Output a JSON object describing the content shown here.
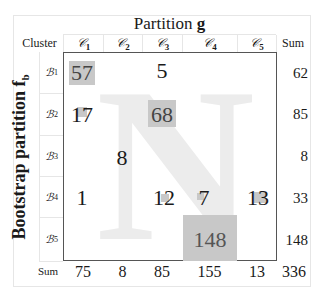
{
  "title": {
    "prefix": "Partition ",
    "var": "g"
  },
  "header": {
    "cluster_label": "Cluster",
    "sum_label": "Sum"
  },
  "columns": [
    {
      "symbol": "𝒞",
      "sub": "1"
    },
    {
      "symbol": "𝒞",
      "sub": "2"
    },
    {
      "symbol": "𝒞",
      "sub": "3"
    },
    {
      "symbol": "𝒞",
      "sub": "4"
    },
    {
      "symbol": "𝒞",
      "sub": "5"
    }
  ],
  "rows": [
    {
      "symbol": "ℬ",
      "sub": "1",
      "sum": "62"
    },
    {
      "symbol": "ℬ",
      "sub": "2",
      "sum": "85"
    },
    {
      "symbol": "ℬ",
      "sub": "3",
      "sum": "8"
    },
    {
      "symbol": "ℬ",
      "sub": "4",
      "sum": "33"
    },
    {
      "symbol": "ℬ",
      "sub": "5",
      "sum": "148"
    }
  ],
  "y_axis_label": {
    "text": "Bootstrap partition f",
    "sub": "b"
  },
  "watermark": "N",
  "matrix": [
    [
      "57",
      "",
      "5",
      "",
      ""
    ],
    [
      "17",
      "",
      "68",
      "",
      ""
    ],
    [
      "",
      "8",
      "",
      "",
      ""
    ],
    [
      "1",
      "",
      "12",
      "7",
      "13"
    ],
    [
      "",
      "",
      "",
      "148",
      ""
    ]
  ],
  "column_sums": {
    "label": "Sum",
    "values": [
      "75",
      "8",
      "85",
      "155",
      "13"
    ],
    "total": "336"
  },
  "colors": {
    "shade": "#c8c8c8",
    "watermark": "#ececec",
    "box_border": "#555555",
    "grid": "#e6e6e6"
  }
}
